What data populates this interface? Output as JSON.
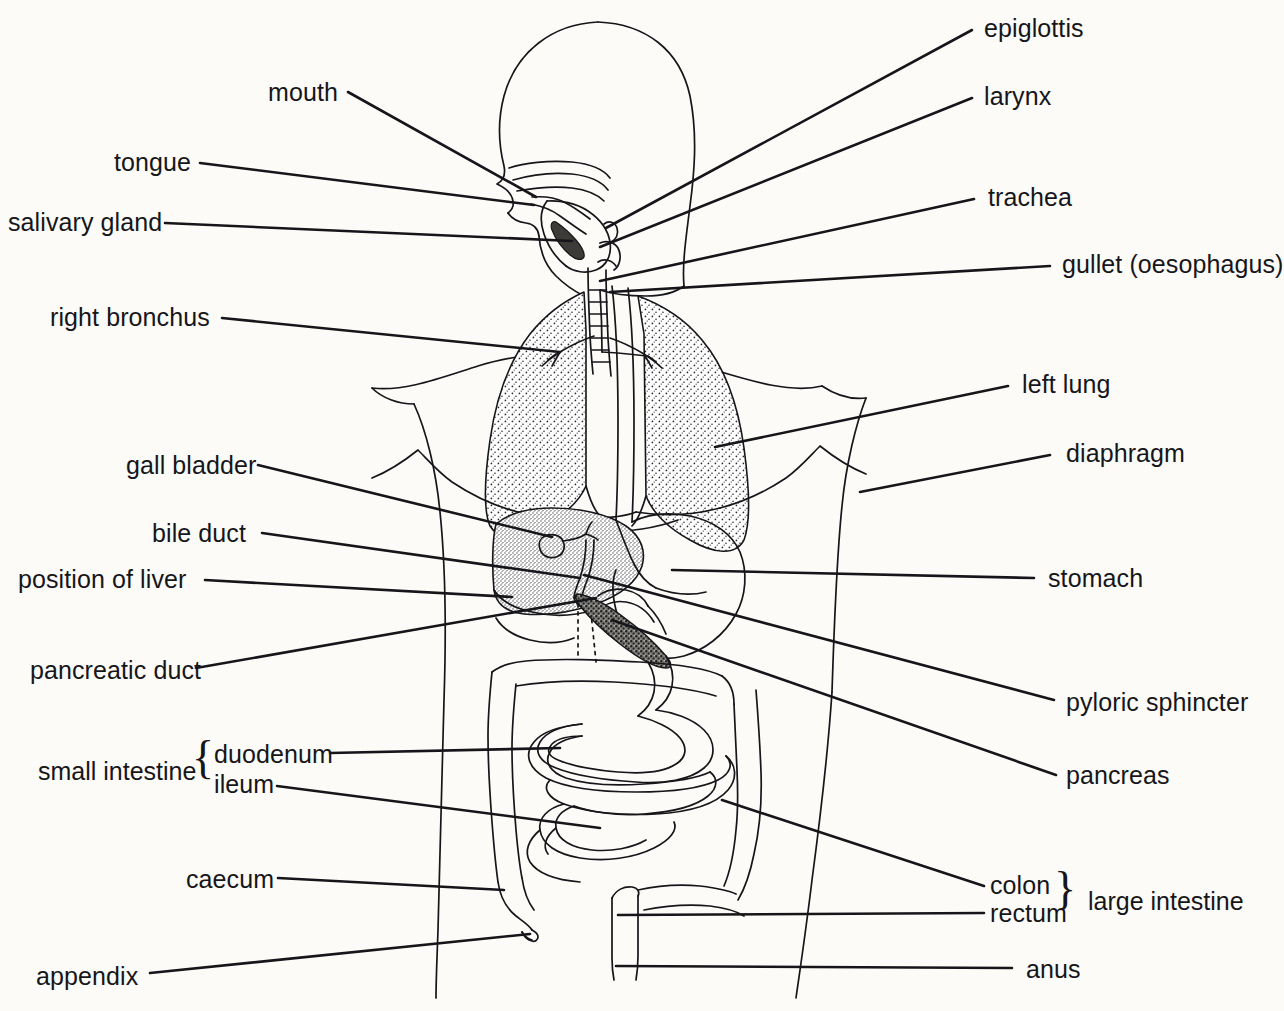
{
  "diagram": {
    "background_color": "#fcfbf8",
    "ink_color": "#16161a",
    "lung_fill": "#f0f0ee",
    "liver_fill": "#dddbd6",
    "pancreas_fill": "#8d8c88"
  },
  "labels_left": [
    {
      "id": "mouth",
      "text": "mouth",
      "x": 268,
      "y": 80,
      "line": [
        [
          348,
          92
        ],
        [
          536,
          197
        ]
      ]
    },
    {
      "id": "tongue",
      "text": "tongue",
      "x": 114,
      "y": 150,
      "line": [
        [
          200,
          163
        ],
        [
          534,
          205
        ]
      ]
    },
    {
      "id": "salivary-gland",
      "text": "salivary gland",
      "x": 8,
      "y": 210,
      "line": [
        [
          165,
          223
        ],
        [
          572,
          241
        ]
      ]
    },
    {
      "id": "right-bronchus",
      "text": "right bronchus",
      "x": 50,
      "y": 305,
      "line": [
        [
          222,
          318
        ],
        [
          560,
          352
        ]
      ]
    },
    {
      "id": "gall-bladder",
      "text": "gall bladder",
      "x": 126,
      "y": 453,
      "line": [
        [
          258,
          465
        ],
        [
          552,
          537
        ]
      ]
    },
    {
      "id": "bile-duct",
      "text": "bile duct",
      "x": 152,
      "y": 521,
      "line": [
        [
          262,
          533
        ],
        [
          580,
          578
        ]
      ]
    },
    {
      "id": "position-of-liver",
      "text": "position of liver",
      "x": 18,
      "y": 567,
      "line": [
        [
          205,
          580
        ],
        [
          512,
          597
        ]
      ]
    },
    {
      "id": "pancreatic-duct",
      "text": "pancreatic duct",
      "x": 30,
      "y": 658,
      "line": [
        [
          196,
          668
        ],
        [
          596,
          598
        ]
      ]
    },
    {
      "id": "duodenum",
      "text": "duodenum",
      "x": 214,
      "y": 742,
      "line": [
        [
          330,
          753
        ],
        [
          560,
          748
        ]
      ]
    },
    {
      "id": "ileum",
      "text": "ileum",
      "x": 214,
      "y": 772,
      "line": [
        [
          277,
          786
        ],
        [
          600,
          828
        ]
      ]
    },
    {
      "id": "caecum",
      "text": "caecum",
      "x": 186,
      "y": 867,
      "line": [
        [
          278,
          878
        ],
        [
          504,
          890
        ]
      ]
    },
    {
      "id": "appendix",
      "text": "appendix",
      "x": 36,
      "y": 964,
      "line": [
        [
          150,
          973
        ],
        [
          530,
          934
        ]
      ]
    }
  ],
  "labels_right": [
    {
      "id": "epiglottis",
      "text": "epiglottis",
      "x": 984,
      "y": 16,
      "line": [
        [
          972,
          30
        ],
        [
          606,
          228
        ]
      ]
    },
    {
      "id": "larynx",
      "text": "larynx",
      "x": 984,
      "y": 84,
      "line": [
        [
          972,
          98
        ],
        [
          600,
          247
        ]
      ]
    },
    {
      "id": "trachea",
      "text": "trachea",
      "x": 988,
      "y": 185,
      "line": [
        [
          974,
          199
        ],
        [
          600,
          281
        ]
      ]
    },
    {
      "id": "gullet",
      "text": "gullet (oesophagus)",
      "x": 1062,
      "y": 252,
      "line": [
        [
          1050,
          266
        ],
        [
          610,
          292
        ]
      ]
    },
    {
      "id": "left-lung",
      "text": "left lung",
      "x": 1022,
      "y": 372,
      "line": [
        [
          1008,
          386
        ],
        [
          715,
          447
        ]
      ]
    },
    {
      "id": "diaphragm",
      "text": "diaphragm",
      "x": 1066,
      "y": 441,
      "line": [
        [
          1050,
          455
        ],
        [
          860,
          492
        ]
      ]
    },
    {
      "id": "stomach",
      "text": "stomach",
      "x": 1048,
      "y": 566,
      "line": [
        [
          1034,
          578
        ],
        [
          672,
          570
        ]
      ]
    },
    {
      "id": "pyloric-sphincter",
      "text": "pyloric sphincter",
      "x": 1066,
      "y": 690,
      "line": [
        [
          1054,
          700
        ],
        [
          584,
          575
        ]
      ]
    },
    {
      "id": "pancreas",
      "text": "pancreas",
      "x": 1066,
      "y": 763,
      "line": [
        [
          1056,
          775
        ],
        [
          612,
          620
        ]
      ]
    },
    {
      "id": "colon",
      "text": "colon",
      "x": 990,
      "y": 873,
      "line": [
        [
          984,
          886
        ],
        [
          722,
          800
        ]
      ]
    },
    {
      "id": "rectum",
      "text": "rectum",
      "x": 990,
      "y": 901,
      "line": [
        [
          984,
          913
        ],
        [
          618,
          915
        ]
      ]
    },
    {
      "id": "anus",
      "text": "anus",
      "x": 1026,
      "y": 957,
      "line": [
        [
          1012,
          968
        ],
        [
          616,
          966
        ]
      ]
    }
  ],
  "groups": [
    {
      "id": "small-intestine",
      "label": "small intestine",
      "x": 38,
      "y": 757,
      "brace_x": 192,
      "brace_y": 735,
      "brace_char": "{"
    },
    {
      "id": "large-intestine",
      "label": "large intestine",
      "x": 1088,
      "y": 887,
      "brace_x": 1054,
      "brace_y": 866,
      "brace_char": "}"
    }
  ]
}
